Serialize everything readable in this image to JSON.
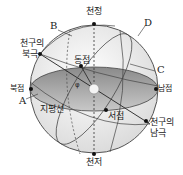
{
  "diagram": {
    "title": "천구",
    "labels": {
      "zenith": "천정",
      "nadir": "천저",
      "north_point": "북점",
      "south_point": "남점",
      "east_point": "동점",
      "west_point": "서점",
      "celestial_north_pole": [
        "천구의",
        "북극"
      ],
      "celestial_south_pole": [
        "천구의",
        "남극"
      ],
      "horizon": "지평선",
      "angle": "φ"
    },
    "letters": [
      "A",
      "B",
      "C",
      "D"
    ]
  }
}
